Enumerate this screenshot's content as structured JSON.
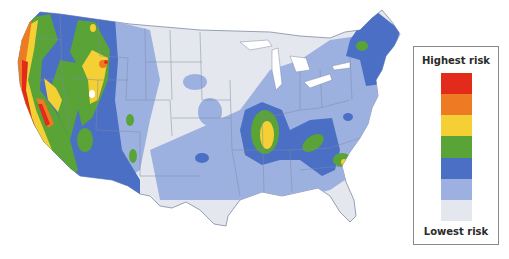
{
  "map": {
    "title": "US earthquake hazard risk map",
    "colors": {
      "land": "#e4e7ee",
      "water": "#ffffff",
      "borders": "#7f8aa6"
    }
  },
  "legend": {
    "top_label": "Highest risk",
    "bottom_label": "Lowest risk",
    "levels": [
      {
        "name": "level-7",
        "color": "#e32b1b"
      },
      {
        "name": "level-6",
        "color": "#ef7a24"
      },
      {
        "name": "level-5",
        "color": "#f4d034"
      },
      {
        "name": "level-4",
        "color": "#5aa336"
      },
      {
        "name": "level-3",
        "color": "#4a6fc4"
      },
      {
        "name": "level-2",
        "color": "#9db1e0"
      },
      {
        "name": "level-1",
        "color": "#e4e7ee"
      }
    ]
  }
}
